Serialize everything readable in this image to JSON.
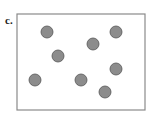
{
  "panel_label": "c.",
  "box": {
    "x": 17,
    "y": 14,
    "width": 128,
    "height": 96,
    "stroke": "#8a8a8a"
  },
  "particle_style": {
    "fill": "#8c8c8c",
    "stroke": "#555555",
    "radius": 6
  },
  "particles": [
    {
      "cx": 47,
      "cy": 32
    },
    {
      "cx": 116,
      "cy": 32
    },
    {
      "cx": 93,
      "cy": 44
    },
    {
      "cx": 58,
      "cy": 56
    },
    {
      "cx": 116,
      "cy": 69
    },
    {
      "cx": 35,
      "cy": 80
    },
    {
      "cx": 81,
      "cy": 80
    },
    {
      "cx": 105,
      "cy": 92
    }
  ]
}
